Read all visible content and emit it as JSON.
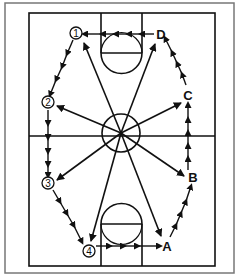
{
  "diagram": {
    "colors": {
      "line": "#111111",
      "frame": "#777777",
      "background": "#ffffff"
    },
    "players_numbered": [
      {
        "label": "1",
        "x": 76,
        "y": 33
      },
      {
        "label": "2",
        "x": 48,
        "y": 102
      },
      {
        "label": "3",
        "x": 48,
        "y": 183
      },
      {
        "label": "4",
        "x": 89,
        "y": 251
      }
    ],
    "players_lettered": [
      {
        "label": "A",
        "x": 167,
        "y": 246
      },
      {
        "label": "B",
        "x": 193,
        "y": 178
      },
      {
        "label": "C",
        "x": 188,
        "y": 95
      },
      {
        "label": "D",
        "x": 161,
        "y": 35
      }
    ],
    "passes_from_center": [
      "1",
      "2",
      "3",
      "4",
      "A",
      "B",
      "C",
      "D"
    ],
    "dribble_paths": [
      {
        "from": "1",
        "to": "2"
      },
      {
        "from": "2",
        "to": "3"
      },
      {
        "from": "3",
        "to": "4"
      },
      {
        "from": "4",
        "to": "A"
      },
      {
        "from": "A",
        "to": "B"
      },
      {
        "from": "B",
        "to": "C"
      },
      {
        "from": "C",
        "to": "D"
      },
      {
        "from": "D",
        "to": "1"
      }
    ]
  }
}
